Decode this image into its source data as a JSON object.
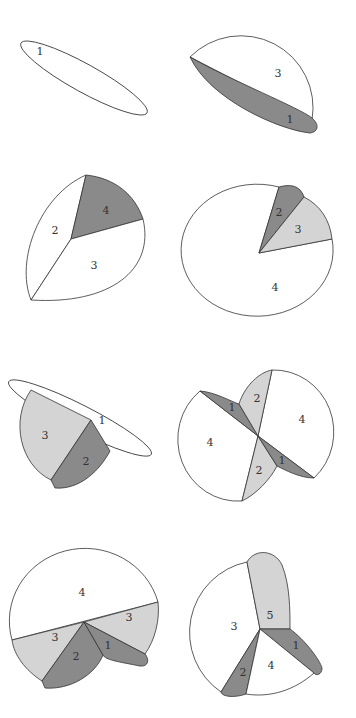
{
  "colors": {
    "white": "#ffffff",
    "light_gray": "#d4d4d4",
    "dark_gray": "#8a8a8a",
    "stroke": "#333333"
  },
  "panels": [
    {
      "id": "p1",
      "labels": [
        "1"
      ]
    },
    {
      "id": "p2",
      "labels": [
        "3",
        "1"
      ]
    },
    {
      "id": "p3",
      "labels": [
        "2",
        "4",
        "3"
      ]
    },
    {
      "id": "p4",
      "labels": [
        "2",
        "3",
        "4"
      ]
    },
    {
      "id": "p5",
      "labels": [
        "1",
        "3",
        "2"
      ]
    },
    {
      "id": "p6",
      "labels": [
        "1",
        "2",
        "4",
        "4",
        "2",
        "1"
      ]
    },
    {
      "id": "p7",
      "labels": [
        "4",
        "3",
        "3",
        "2",
        "1"
      ]
    },
    {
      "id": "p8",
      "labels": [
        "5",
        "3",
        "1",
        "2",
        "4"
      ]
    }
  ]
}
